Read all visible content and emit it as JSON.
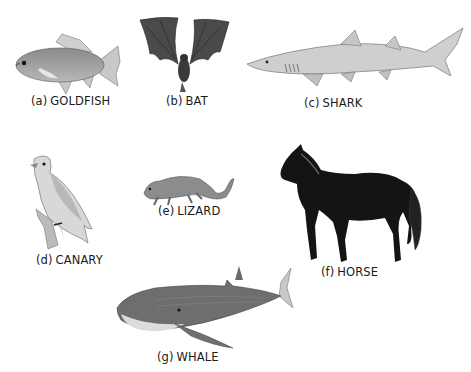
{
  "figure": {
    "background": "#ffffff",
    "panels": [
      {
        "id": "a",
        "tag": "(a)",
        "name": "GOLDFISH",
        "icon": "goldfish-icon"
      },
      {
        "id": "b",
        "tag": "(b)",
        "name": "BAT",
        "icon": "bat-icon"
      },
      {
        "id": "c",
        "tag": "(c)",
        "name": "SHARK",
        "icon": "shark-icon"
      },
      {
        "id": "d",
        "tag": "(d)",
        "name": "CANARY",
        "icon": "canary-icon"
      },
      {
        "id": "e",
        "tag": "(e)",
        "name": "LIZARD",
        "icon": "lizard-icon"
      },
      {
        "id": "f",
        "tag": "(f)",
        "name": "HORSE",
        "icon": "horse-icon"
      },
      {
        "id": "g",
        "tag": "(g)",
        "name": "WHALE",
        "icon": "whale-icon"
      }
    ]
  }
}
